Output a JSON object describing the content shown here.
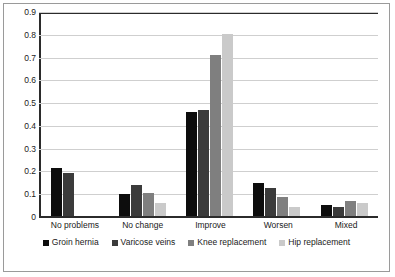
{
  "chart_data": {
    "type": "bar",
    "title": "",
    "subtitle": "",
    "xlabel": "",
    "ylabel": "",
    "ylim": [
      0,
      0.9
    ],
    "ytick_labels": [
      "0.9",
      "0.8",
      "0.7",
      "0.6",
      "0.5",
      "0.4",
      "0.3",
      "0.2",
      "0.1",
      "0"
    ],
    "ytick_values": [
      0.9,
      0.8,
      0.7,
      0.6,
      0.5,
      0.4,
      0.3,
      0.2,
      0.1,
      0
    ],
    "grid": true,
    "legend_position": "bottom",
    "orientation": "vertical",
    "categories": [
      "No problems",
      "No change",
      "Improve",
      "Worsen",
      "Mixed"
    ],
    "series": [
      {
        "name": "Groin hernia",
        "color": "#0d0d0d",
        "values": [
          0.21,
          0.095,
          0.455,
          0.145,
          0.05
        ]
      },
      {
        "name": "Varicose veins",
        "color": "#3b3b3b",
        "values": [
          0.19,
          0.135,
          0.465,
          0.125,
          0.04
        ]
      },
      {
        "name": "Knee replacement",
        "color": "#7f7f7f",
        "values": [
          null,
          0.1,
          0.705,
          0.085,
          0.065
        ]
      },
      {
        "name": "Hip replacement",
        "color": "#cacaca",
        "values": [
          null,
          0.055,
          0.8,
          0.04,
          0.055
        ]
      }
    ]
  }
}
